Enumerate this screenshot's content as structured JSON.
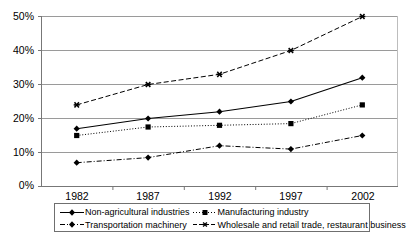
{
  "chart_data": {
    "type": "line",
    "title": "",
    "xlabel": "",
    "ylabel": "",
    "categories": [
      "1982",
      "1987",
      "1992",
      "1997",
      "2002"
    ],
    "ylim": [
      0,
      50
    ],
    "ytick_labels": [
      "0%",
      "10%",
      "20%",
      "30%",
      "40%",
      "50%"
    ],
    "ytick_values": [
      0,
      10,
      20,
      30,
      40,
      50
    ],
    "grid": true,
    "legend_position": "bottom",
    "series": [
      {
        "name": "Non-agricultural industries",
        "values": [
          17,
          20,
          22,
          25,
          32
        ],
        "line_style": "solid",
        "marker": "diamond",
        "color": "#000000"
      },
      {
        "name": "Manufacturing industry",
        "values": [
          15,
          17.5,
          18,
          18.5,
          24
        ],
        "line_style": "dotted",
        "marker": "square",
        "color": "#000000"
      },
      {
        "name": "Transportation machinery",
        "values": [
          7,
          8.5,
          12,
          11,
          15
        ],
        "line_style": "dashdot",
        "marker": "diamond",
        "color": "#000000"
      },
      {
        "name": "Wholesale and retail trade, restaurant business",
        "values": [
          24,
          30,
          33,
          40,
          50
        ],
        "line_style": "dashed",
        "marker": "asterisk",
        "color": "#000000"
      }
    ]
  },
  "legend": {
    "items": [
      {
        "label": "Non-agricultural industries"
      },
      {
        "label": "Manufacturing industry"
      },
      {
        "label": "Transportation machinery"
      },
      {
        "label": "Wholesale and retail trade, restaurant business"
      }
    ]
  },
  "colors": {
    "axis": "#808080",
    "grid": "#9a9a9a",
    "series": "#000000",
    "legend_border": "#6f6f6f",
    "background": "#ffffff"
  }
}
